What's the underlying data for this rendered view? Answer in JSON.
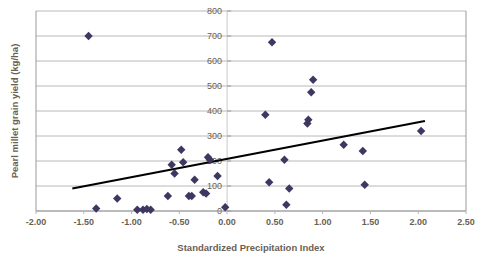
{
  "chart_data": {
    "type": "scatter",
    "title": "",
    "xlabel": "Standardized Precipitation Index",
    "ylabel": "Pearl millet grain yield (kg/ha)",
    "xlim": [
      -2.0,
      2.5
    ],
    "ylim": [
      0,
      800
    ],
    "xticks": [
      "-2.00",
      "-1.50",
      "-1.00",
      "-0.50",
      "0.00",
      "0.50",
      "1.00",
      "1.50",
      "2.00",
      "2.50"
    ],
    "xtick_values": [
      -2.0,
      -1.5,
      -1.0,
      -0.5,
      0.0,
      0.5,
      1.0,
      1.5,
      2.0,
      2.5
    ],
    "yticks": [
      "0",
      "100",
      "200",
      "300",
      "400",
      "500",
      "600",
      "700",
      "800"
    ],
    "ytick_values": [
      0,
      100,
      200,
      300,
      400,
      500,
      600,
      700,
      800
    ],
    "grid": "horizontal",
    "legend": "none",
    "marker_shape": "diamond",
    "marker_color": "#3d3762",
    "trendline_color": "#000000",
    "gridline_color": "#b0b0b0",
    "frame_color": "#9a9a9a",
    "label_color": "#6b5f52",
    "series": [
      {
        "name": "Pearl millet grain yield",
        "points": [
          [
            -1.45,
            700
          ],
          [
            -1.37,
            10
          ],
          [
            -1.15,
            50
          ],
          [
            -0.94,
            5
          ],
          [
            -0.88,
            5
          ],
          [
            -0.84,
            8
          ],
          [
            -0.8,
            5
          ],
          [
            -0.62,
            60
          ],
          [
            -0.58,
            185
          ],
          [
            -0.55,
            150
          ],
          [
            -0.48,
            245
          ],
          [
            -0.46,
            195
          ],
          [
            -0.4,
            60
          ],
          [
            -0.37,
            60
          ],
          [
            -0.34,
            125
          ],
          [
            -0.25,
            75
          ],
          [
            -0.22,
            70
          ],
          [
            -0.2,
            215
          ],
          [
            -0.18,
            205
          ],
          [
            -0.1,
            140
          ],
          [
            -0.02,
            15
          ],
          [
            0.4,
            385
          ],
          [
            0.44,
            115
          ],
          [
            0.47,
            675
          ],
          [
            0.6,
            205
          ],
          [
            0.62,
            25
          ],
          [
            0.65,
            90
          ],
          [
            0.84,
            350
          ],
          [
            0.85,
            365
          ],
          [
            0.88,
            475
          ],
          [
            0.9,
            525
          ],
          [
            1.22,
            265
          ],
          [
            1.42,
            240
          ],
          [
            1.44,
            105
          ],
          [
            2.03,
            320
          ]
        ]
      }
    ],
    "trendline": {
      "x_start": -1.62,
      "y_start": 90,
      "x_end": 2.07,
      "y_end": 360
    }
  }
}
